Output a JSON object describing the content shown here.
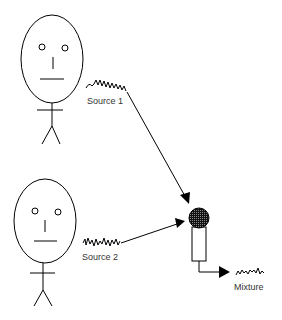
{
  "diagram": {
    "sources": [
      {
        "label": "Source 1"
      },
      {
        "label": "Source 2"
      }
    ],
    "output": {
      "label": "Mixture"
    },
    "colors": {
      "stroke": "#000000",
      "text": "#333333",
      "mic_head": "#222222"
    }
  }
}
